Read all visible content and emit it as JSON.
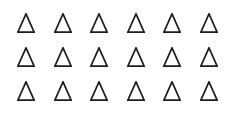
{
  "image": {
    "description": "Array of outline triangles on a plain white background",
    "background_color": "#ffffff",
    "width": 235,
    "height": 114
  },
  "shape_array": {
    "shape_name": "triangle",
    "icon_name": "triangle-outline-icon",
    "glyph": "△",
    "fill": "none",
    "stroke_color": "#1c1c1c",
    "stroke_width": 1.7,
    "rows": 3,
    "columns": 6,
    "total_count": 18,
    "cell_width": 18,
    "cell_height": 20,
    "items": [
      {
        "row": 1,
        "col": 1,
        "label": "triangle-r1-c1"
      },
      {
        "row": 1,
        "col": 2,
        "label": "triangle-r1-c2"
      },
      {
        "row": 1,
        "col": 3,
        "label": "triangle-r1-c3"
      },
      {
        "row": 1,
        "col": 4,
        "label": "triangle-r1-c4"
      },
      {
        "row": 1,
        "col": 5,
        "label": "triangle-r1-c5"
      },
      {
        "row": 1,
        "col": 6,
        "label": "triangle-r1-c6"
      },
      {
        "row": 2,
        "col": 1,
        "label": "triangle-r2-c1"
      },
      {
        "row": 2,
        "col": 2,
        "label": "triangle-r2-c2"
      },
      {
        "row": 2,
        "col": 3,
        "label": "triangle-r2-c3"
      },
      {
        "row": 2,
        "col": 4,
        "label": "triangle-r2-c4"
      },
      {
        "row": 2,
        "col": 5,
        "label": "triangle-r2-c5"
      },
      {
        "row": 2,
        "col": 6,
        "label": "triangle-r2-c6"
      },
      {
        "row": 3,
        "col": 1,
        "label": "triangle-r3-c1"
      },
      {
        "row": 3,
        "col": 2,
        "label": "triangle-r3-c2"
      },
      {
        "row": 3,
        "col": 3,
        "label": "triangle-r3-c3"
      },
      {
        "row": 3,
        "col": 4,
        "label": "triangle-r3-c4"
      },
      {
        "row": 3,
        "col": 5,
        "label": "triangle-r3-c5"
      },
      {
        "row": 3,
        "col": 6,
        "label": "triangle-r3-c6"
      }
    ]
  }
}
